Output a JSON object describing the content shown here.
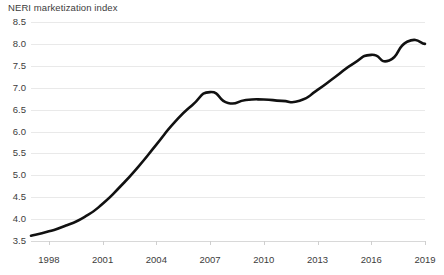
{
  "chart_data": {
    "type": "line",
    "title": "NERI marketization index",
    "xlabel": "",
    "ylabel": "",
    "grid": true,
    "legend": false,
    "legend_position": "none",
    "line_color": "#111111",
    "grid_color": "#e9e9e9",
    "background_color": "#ffffff",
    "xlim": [
      1997,
      2019
    ],
    "ylim": [
      3.5,
      8.5
    ],
    "ytick_labels": [
      "8.5",
      "8.0",
      "7.5",
      "7.0",
      "6.5",
      "6.0",
      "5.5",
      "5.0",
      "4.5",
      "4.0",
      "3.5"
    ],
    "ytick_values": [
      8.5,
      8.0,
      7.5,
      7.0,
      6.5,
      6.0,
      5.5,
      5.0,
      4.5,
      4.0,
      3.5
    ],
    "xtick_labels": [
      "1998",
      "2001",
      "2004",
      "2007",
      "2010",
      "2013",
      "2016",
      "2019"
    ],
    "xtick_values": [
      1998,
      2001,
      2004,
      2007,
      2010,
      2013,
      2016,
      2019
    ],
    "x": [
      1997,
      1998,
      1999,
      2000,
      2001,
      2002,
      2003,
      2004,
      2005,
      2006,
      2007,
      2008,
      2009,
      2010,
      2011,
      2012,
      2013,
      2014,
      2015,
      2016,
      2017,
      2018,
      2019
    ],
    "series": [
      {
        "name": "NERI marketization index",
        "values": [
          3.62,
          3.72,
          3.86,
          4.05,
          4.35,
          4.75,
          5.2,
          5.7,
          6.2,
          6.6,
          6.9,
          6.65,
          6.72,
          6.73,
          6.7,
          6.7,
          6.95,
          7.25,
          7.55,
          7.75,
          7.62,
          8.05,
          8.0
        ]
      }
    ]
  }
}
